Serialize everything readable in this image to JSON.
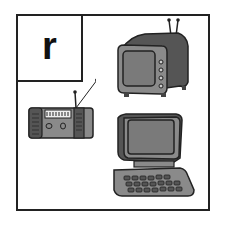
{
  "card": {
    "letter": "r",
    "pictures": [
      {
        "name": "television"
      },
      {
        "name": "radio"
      },
      {
        "name": "computer"
      }
    ]
  },
  "colors": {
    "outline": "#222222",
    "body_dark": "#555555",
    "body_mid": "#8a8a8a",
    "screen": "#7a7a7a"
  }
}
